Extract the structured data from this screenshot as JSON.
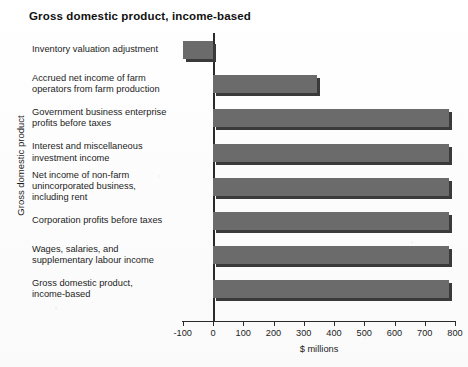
{
  "chart_data": {
    "type": "bar",
    "orientation": "horizontal",
    "title": "Gross domestic product, income-based",
    "xlabel": "$ millions",
    "ylabel": "Gross domestic product",
    "xlim": [
      -100,
      800
    ],
    "xticks": [
      -100,
      0,
      100,
      200,
      300,
      400,
      500,
      600,
      700,
      800
    ],
    "xtick_labels": [
      "-100",
      "0",
      "100",
      "200",
      "300",
      "400",
      "500",
      "600",
      "700",
      "800"
    ],
    "grid": false,
    "legend": null,
    "bar_color": "#6b6b6b",
    "shadow_color": "#3a3a3a",
    "categories": [
      "Inventory valuation adjustment",
      "Accrued net income of farm operators from farm production",
      "Government business enterprise profits before taxes",
      "Interest and miscellaneous investment income",
      "Net income of non-farm unincorporated business, including rent",
      "Corporation profits before taxes",
      "Wages, salaries, and supplementary labour income",
      "Gross domestic product, income-based"
    ],
    "category_lines": [
      [
        "Inventory valuation adjustment"
      ],
      [
        "Accrued net income of farm",
        "operators from farm production"
      ],
      [
        "Government business enterprise",
        "profits before taxes"
      ],
      [
        "Interest and miscellaneous",
        "investment income"
      ],
      [
        "Net income of non-farm",
        "unincorporated business,",
        "including rent"
      ],
      [
        "Corporation profits before taxes"
      ],
      [
        "Wages, salaries, and",
        "supplementary labour income"
      ],
      [
        "Gross domestic product,",
        "income-based"
      ]
    ],
    "values": [
      -100,
      345,
      780,
      780,
      780,
      780,
      780,
      780
    ]
  }
}
